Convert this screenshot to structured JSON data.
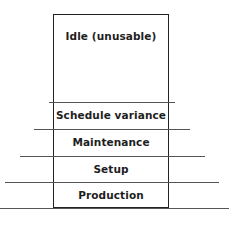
{
  "diagram": {
    "title": "",
    "layers": [
      {
        "label": "Idle (unusable)"
      },
      {
        "label": "Schedule variance"
      },
      {
        "label": "Maintenance"
      },
      {
        "label": "Setup"
      },
      {
        "label": "Production"
      }
    ],
    "colors": {
      "line": "#222222",
      "text": "#1e1e1e",
      "background": "#ffffff"
    }
  }
}
